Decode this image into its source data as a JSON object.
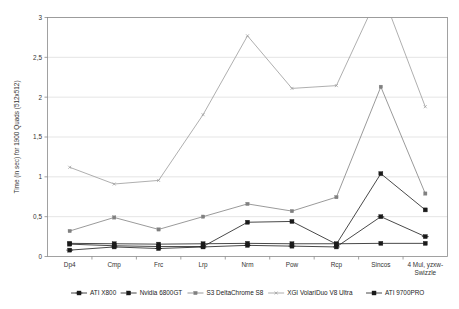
{
  "chart_data": {
    "type": "line",
    "title": "",
    "xlabel": "",
    "ylabel": "Time (in sec) for 1900 Quads (512x512)",
    "ylim": [
      0,
      3
    ],
    "yticks": [
      0,
      0.5,
      1,
      1.5,
      2,
      2.5,
      3
    ],
    "ytick_labels": [
      "0",
      "0,5",
      "1",
      "1,5",
      "2",
      "2,5",
      "3"
    ],
    "grid": true,
    "legend_position": "bottom",
    "categories": [
      "Dp4",
      "Cmp",
      "Frc",
      "Lrp",
      "Nrm",
      "Pow",
      "Rcp",
      "Sincos",
      "4 Mul, yzxw-Swizzle"
    ],
    "series": [
      {
        "name": "ATI X800",
        "marker": "plus-diamond",
        "color": "#1a1a1a",
        "values": [
          0.08,
          0.12,
          0.1,
          0.12,
          0.14,
          0.13,
          0.12,
          0.5,
          0.25
        ]
      },
      {
        "name": "Nvidia 6800GT",
        "marker": "square",
        "color": "#1a1a1a",
        "values": [
          0.165,
          0.16,
          0.155,
          0.16,
          0.165,
          0.16,
          0.16,
          0.165,
          0.165
        ]
      },
      {
        "name": "S3 DeltaChrome S8",
        "marker": "small-triangle",
        "color": "#808080",
        "values": [
          0.32,
          0.49,
          0.34,
          0.5,
          0.66,
          0.57,
          0.745,
          2.13,
          0.79
        ]
      },
      {
        "name": "XGI VolariDuo V8 Ultra",
        "marker": "asterisk",
        "color": "#9a9a9a",
        "values": [
          1.12,
          0.91,
          0.955,
          1.78,
          2.77,
          2.11,
          2.145,
          3.35,
          1.88
        ]
      },
      {
        "name": "ATI 9700PRO",
        "marker": "filled-diamond",
        "color": "#1a1a1a",
        "values": [
          0.155,
          0.135,
          0.125,
          0.125,
          0.43,
          0.44,
          0.155,
          1.04,
          0.585
        ]
      }
    ]
  },
  "legend": {
    "items": [
      {
        "label": "ATI X800"
      },
      {
        "label": "Nvidia 6800GT"
      },
      {
        "label": "S3 DeltaChrome S8"
      },
      {
        "label": "XGI VolariDuo V8 Ultra"
      },
      {
        "label": "ATI 9700PRO"
      }
    ]
  }
}
